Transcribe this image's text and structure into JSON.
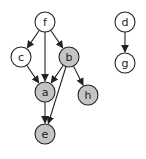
{
  "diagram": {
    "type": "directed-graph",
    "colors": {
      "stroke": "#222222",
      "unfilled": "#ffffff",
      "filled": "#c4c4c4"
    },
    "node_radius": 10,
    "nodes": [
      {
        "id": "f",
        "label": "f",
        "x": 45,
        "y": 22,
        "filled": false
      },
      {
        "id": "c",
        "label": "c",
        "x": 21,
        "y": 57,
        "filled": false
      },
      {
        "id": "b",
        "label": "b",
        "x": 69,
        "y": 57,
        "filled": true
      },
      {
        "id": "a",
        "label": "a",
        "x": 45,
        "y": 92,
        "filled": true
      },
      {
        "id": "h",
        "label": "h",
        "x": 88,
        "y": 95,
        "filled": true
      },
      {
        "id": "e",
        "label": "e",
        "x": 45,
        "y": 134,
        "filled": true
      },
      {
        "id": "d",
        "label": "d",
        "x": 125,
        "y": 22,
        "filled": false
      },
      {
        "id": "g",
        "label": "g",
        "x": 125,
        "y": 63,
        "filled": false
      }
    ],
    "edges": [
      {
        "from": "f",
        "to": "c"
      },
      {
        "from": "f",
        "to": "a"
      },
      {
        "from": "f",
        "to": "b"
      },
      {
        "from": "c",
        "to": "a"
      },
      {
        "from": "b",
        "to": "a"
      },
      {
        "from": "b",
        "to": "h"
      },
      {
        "from": "b",
        "to": "e"
      },
      {
        "from": "a",
        "to": "e"
      },
      {
        "from": "d",
        "to": "g"
      }
    ]
  }
}
